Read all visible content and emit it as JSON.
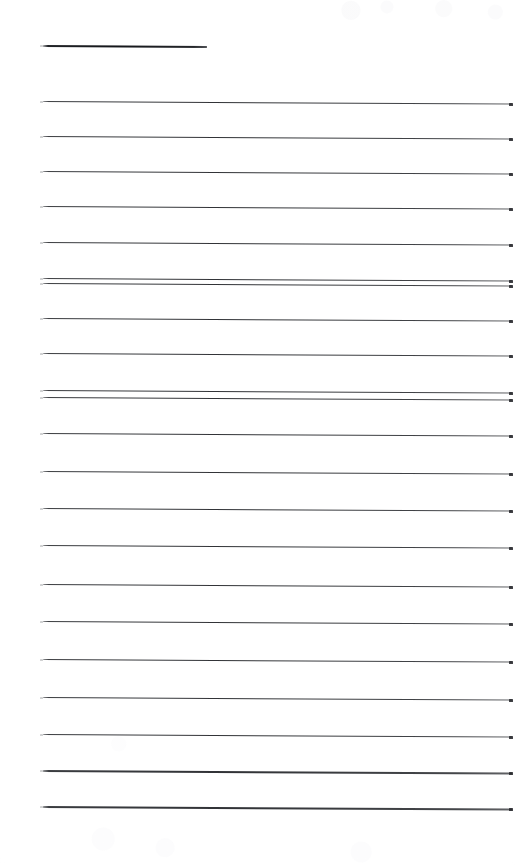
{
  "document": {
    "kind": "scanned-lined-paper",
    "title": "Blank ruled notebook page (scan)",
    "page_width": 516,
    "page_height": 865,
    "background_color": "#ffffff",
    "ink_color": "#2a2c30",
    "visible_text": "",
    "note": "No text, labels, numbers or icons are present on the page."
  },
  "ruling": {
    "line_count": 21,
    "left_margin_x": 43,
    "right_edge_x": 512,
    "first_line_y": 45,
    "nominal_spacing": 36,
    "skew_degrees": 0.32,
    "description": "Horizontal ruled lines, slightly skewed downward to the right from scanning.",
    "lines": [
      {
        "index": 1,
        "y": 45,
        "x_start": 43,
        "x_end": 207,
        "weight": 1.9,
        "kind": "title-rule"
      },
      {
        "index": 2,
        "y": 101,
        "x_start": 43,
        "x_end": 512,
        "weight": 1.4,
        "kind": "rule"
      },
      {
        "index": 3,
        "y": 136,
        "x_start": 43,
        "x_end": 512,
        "weight": 1.4,
        "kind": "rule"
      },
      {
        "index": 4,
        "y": 171,
        "x_start": 43,
        "x_end": 512,
        "weight": 1.4,
        "kind": "rule"
      },
      {
        "index": 5,
        "y": 206,
        "x_start": 43,
        "x_end": 512,
        "weight": 1.4,
        "kind": "rule"
      },
      {
        "index": 6,
        "y": 242,
        "x_start": 43,
        "x_end": 512,
        "weight": 1.4,
        "kind": "rule"
      },
      {
        "index": 7,
        "y": 278,
        "x_start": 43,
        "x_end": 512,
        "weight": 1.4,
        "kind": "rule"
      },
      {
        "index": 8,
        "y": 283,
        "x_start": 43,
        "x_end": 512,
        "weight": 1.2,
        "kind": "rule"
      },
      {
        "index": 9,
        "y": 318,
        "x_start": 43,
        "x_end": 512,
        "weight": 1.4,
        "kind": "rule"
      },
      {
        "index": 10,
        "y": 353,
        "x_start": 43,
        "x_end": 512,
        "weight": 1.4,
        "kind": "rule"
      },
      {
        "index": 11,
        "y": 390,
        "x_start": 43,
        "x_end": 512,
        "weight": 1.4,
        "kind": "rule"
      },
      {
        "index": 12,
        "y": 397,
        "x_start": 43,
        "x_end": 512,
        "weight": 1.2,
        "kind": "rule"
      },
      {
        "index": 13,
        "y": 433,
        "x_start": 43,
        "x_end": 512,
        "weight": 1.4,
        "kind": "rule"
      },
      {
        "index": 14,
        "y": 471,
        "x_start": 43,
        "x_end": 512,
        "weight": 1.4,
        "kind": "rule"
      },
      {
        "index": 15,
        "y": 508,
        "x_start": 43,
        "x_end": 512,
        "weight": 1.4,
        "kind": "rule"
      },
      {
        "index": 16,
        "y": 545,
        "x_start": 43,
        "x_end": 512,
        "weight": 1.4,
        "kind": "rule"
      },
      {
        "index": 17,
        "y": 584,
        "x_start": 43,
        "x_end": 512,
        "weight": 1.4,
        "kind": "rule"
      },
      {
        "index": 18,
        "y": 621,
        "x_start": 43,
        "x_end": 512,
        "weight": 1.4,
        "kind": "rule"
      },
      {
        "index": 19,
        "y": 659,
        "x_start": 43,
        "x_end": 512,
        "weight": 1.4,
        "kind": "rule"
      },
      {
        "index": 20,
        "y": 697,
        "x_start": 43,
        "x_end": 512,
        "weight": 1.4,
        "kind": "rule"
      },
      {
        "index": 21,
        "y": 734,
        "x_start": 43,
        "x_end": 512,
        "weight": 1.4,
        "kind": "rule"
      },
      {
        "index": 22,
        "y": 770,
        "x_start": 43,
        "x_end": 512,
        "weight": 1.5,
        "kind": "rule"
      },
      {
        "index": 23,
        "y": 806,
        "x_start": 43,
        "x_end": 512,
        "weight": 1.5,
        "kind": "rule"
      }
    ]
  }
}
